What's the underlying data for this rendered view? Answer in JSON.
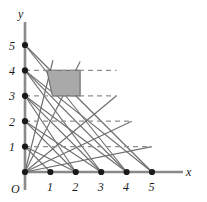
{
  "figure": {
    "title": "",
    "axis_labels": {
      "x": "x",
      "y": "y",
      "origin": "O"
    },
    "x_ticks": [
      "1",
      "2",
      "3",
      "4",
      "5"
    ],
    "y_ticks": [
      "1",
      "2",
      "3",
      "4",
      "5"
    ],
    "colors": {
      "axis": "#8a8a8a",
      "line": "#6e6e6e",
      "dashed": "#8f8f8f",
      "dot": "#1a1a1a",
      "shade_fill": "#a9a9a9",
      "shade_stroke": "#6e6e6e",
      "text": "#1a1a1a",
      "background": "#ffffff"
    }
  },
  "chart_data": {
    "type": "line",
    "title": "",
    "xlabel": "x",
    "ylabel": "y",
    "xlim": [
      0,
      5.6
    ],
    "ylim": [
      0,
      5.6
    ],
    "grid": false,
    "legend": null,
    "x_tick_values": [
      1,
      2,
      3,
      4,
      5
    ],
    "y_tick_values": [
      1,
      2,
      3,
      4,
      5
    ],
    "axis_dots_x": [
      {
        "x": 0,
        "y": 0
      },
      {
        "x": 1,
        "y": 0
      },
      {
        "x": 2,
        "y": 0
      },
      {
        "x": 3,
        "y": 0
      },
      {
        "x": 4,
        "y": 0
      },
      {
        "x": 5,
        "y": 0
      }
    ],
    "axis_dots_y": [
      {
        "x": 0,
        "y": 1
      },
      {
        "x": 0,
        "y": 2
      },
      {
        "x": 0,
        "y": 3
      },
      {
        "x": 0,
        "y": 4
      },
      {
        "x": 0,
        "y": 5
      }
    ],
    "dashed_horizontal_lines": [
      {
        "y": 1,
        "x_start": 0,
        "x_end": 5.0
      },
      {
        "y": 2,
        "x_start": 0,
        "x_end": 4.2
      },
      {
        "y": 3,
        "x_start": 0,
        "x_end": 3.6
      },
      {
        "y": 4,
        "x_start": 0,
        "x_end": 3.6
      }
    ],
    "segments": [
      {
        "name": "seg-0-5-to-5-0",
        "x1": 0,
        "y1": 5,
        "x2": 5,
        "y2": 0
      },
      {
        "name": "seg-0-5-to-4-0",
        "x1": 0,
        "y1": 5,
        "x2": 4,
        "y2": 0
      },
      {
        "name": "seg-0-4-to-5-0",
        "x1": 0,
        "y1": 4,
        "x2": 5,
        "y2": 0
      },
      {
        "name": "seg-0-4-to-4-0",
        "x1": 0,
        "y1": 4,
        "x2": 4,
        "y2": 0
      },
      {
        "name": "seg-0-4-to-3-0",
        "x1": 0,
        "y1": 4,
        "x2": 3,
        "y2": 0
      },
      {
        "name": "seg-0-3-to-4-0",
        "x1": 0,
        "y1": 3,
        "x2": 4,
        "y2": 0
      },
      {
        "name": "seg-0-3-to-3-0",
        "x1": 0,
        "y1": 3,
        "x2": 3,
        "y2": 0
      },
      {
        "name": "seg-0-3-to-2-0",
        "x1": 0,
        "y1": 3,
        "x2": 2,
        "y2": 0
      },
      {
        "name": "seg-0-2-to-3-0",
        "x1": 0,
        "y1": 2,
        "x2": 3,
        "y2": 0
      },
      {
        "name": "seg-0-2-to-2-0",
        "x1": 0,
        "y1": 2,
        "x2": 2,
        "y2": 0
      },
      {
        "name": "seg-0-1-to-2-0",
        "x1": 0,
        "y1": 1,
        "x2": 2,
        "y2": 0
      },
      {
        "name": "seg-0-1-to-1-0",
        "x1": 0,
        "y1": 1,
        "x2": 1,
        "y2": 0
      },
      {
        "name": "seg-origin-to-5-1",
        "x1": 0,
        "y1": 0,
        "x2": 5,
        "y2": 1
      },
      {
        "name": "seg-origin-to-4-2",
        "x1": 0,
        "y1": 0,
        "x2": 4.2,
        "y2": 2
      },
      {
        "name": "seg-origin-to-3-3",
        "x1": 0,
        "y1": 0,
        "x2": 3.6,
        "y2": 3
      },
      {
        "name": "seg-origin-to-2-4",
        "x1": 0,
        "y1": 0,
        "x2": 2.17,
        "y2": 4.35
      },
      {
        "name": "seg-origin-to-1-4",
        "x1": 0,
        "y1": 0,
        "x2": 1.1,
        "y2": 4.4
      }
    ],
    "shaded_region": {
      "name": "shaded-quadrilateral",
      "vertices": [
        {
          "x": 0.86,
          "y": 4.0
        },
        {
          "x": 2.17,
          "y": 4.0
        },
        {
          "x": 2.17,
          "y": 3.0
        },
        {
          "x": 1.08,
          "y": 3.0
        }
      ],
      "fill": "#a9a9a9"
    }
  }
}
